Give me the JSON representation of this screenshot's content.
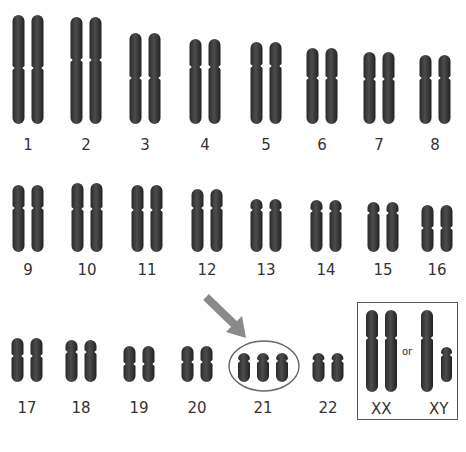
{
  "figure": {
    "highlight_color": "#888888",
    "chromosome_color": "#3a3a3a"
  },
  "chromosomes": [
    {
      "label": "1",
      "cx": 28,
      "top": 15,
      "bottom": 124,
      "cen": 68,
      "copies": 2
    },
    {
      "label": "2",
      "cx": 86,
      "top": 17,
      "bottom": 124,
      "cen": 60,
      "copies": 2
    },
    {
      "label": "3",
      "cx": 145,
      "top": 33,
      "bottom": 124,
      "cen": 78,
      "copies": 2
    },
    {
      "label": "4",
      "cx": 205,
      "top": 39,
      "bottom": 124,
      "cen": 67,
      "copies": 2
    },
    {
      "label": "5",
      "cx": 266,
      "top": 42,
      "bottom": 124,
      "cen": 66,
      "copies": 2
    },
    {
      "label": "6",
      "cx": 322,
      "top": 48,
      "bottom": 124,
      "cen": 78,
      "copies": 2
    },
    {
      "label": "7",
      "cx": 379,
      "top": 52,
      "bottom": 124,
      "cen": 79,
      "copies": 2
    },
    {
      "label": "8",
      "cx": 435,
      "top": 55,
      "bottom": 124,
      "cen": 78,
      "copies": 2
    },
    {
      "label": "9",
      "cx": 28,
      "top": 185,
      "bottom": 252,
      "cen": 208,
      "copies": 2
    },
    {
      "label": "10",
      "cx": 87,
      "top": 183,
      "bottom": 252,
      "cen": 209,
      "copies": 2
    },
    {
      "label": "11",
      "cx": 147,
      "top": 185,
      "bottom": 252,
      "cen": 210,
      "copies": 2
    },
    {
      "label": "12",
      "cx": 207,
      "top": 189,
      "bottom": 252,
      "cen": 208,
      "copies": 2
    },
    {
      "label": "13",
      "cx": 266,
      "top": 199,
      "bottom": 252,
      "cen": 210,
      "copies": 2
    },
    {
      "label": "14",
      "cx": 326,
      "top": 200,
      "bottom": 252,
      "cen": 211,
      "copies": 2
    },
    {
      "label": "15",
      "cx": 383,
      "top": 202,
      "bottom": 252,
      "cen": 213,
      "copies": 2
    },
    {
      "label": "16",
      "cx": 437,
      "top": 205,
      "bottom": 252,
      "cen": 228,
      "copies": 2
    },
    {
      "label": "17",
      "cx": 27,
      "top": 338,
      "bottom": 382,
      "cen": 356,
      "copies": 2
    },
    {
      "label": "18",
      "cx": 81,
      "top": 340,
      "bottom": 382,
      "cen": 352,
      "copies": 2
    },
    {
      "label": "19",
      "cx": 139,
      "top": 346,
      "bottom": 382,
      "cen": 364,
      "copies": 2
    },
    {
      "label": "20",
      "cx": 197,
      "top": 346,
      "bottom": 382,
      "cen": 362,
      "copies": 2
    },
    {
      "label": "21",
      "cx": 263,
      "top": 353,
      "bottom": 382,
      "cen": 361,
      "copies": 3
    },
    {
      "label": "22",
      "cx": 328,
      "top": 353,
      "bottom": 382,
      "cen": 361,
      "copies": 2
    }
  ],
  "row_labels_y": [
    145,
    270,
    408
  ],
  "sex_chromosomes": {
    "xx_label": "XX",
    "or_label": "or",
    "xy_label": "XY"
  },
  "annotation": {
    "arrow": "points to chromosome 21",
    "circle": "ellipse around three copies of chromosome 21"
  }
}
